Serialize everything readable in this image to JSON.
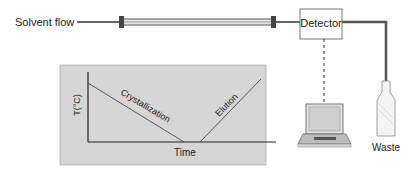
{
  "labels": {
    "solvent_flow": "Solvent flow",
    "detector": "Detector",
    "waste": "Waste"
  },
  "inset_plot": {
    "ylabel": "T(°C)",
    "xlabel": "Time",
    "segments": [
      {
        "name": "Crystallization",
        "trend": "decreasing"
      },
      {
        "name": "Elution",
        "trend": "increasing"
      }
    ]
  },
  "colors": {
    "line": "#555555",
    "inset_bg": "#d6d6d6",
    "column": "#bbbbbb"
  }
}
